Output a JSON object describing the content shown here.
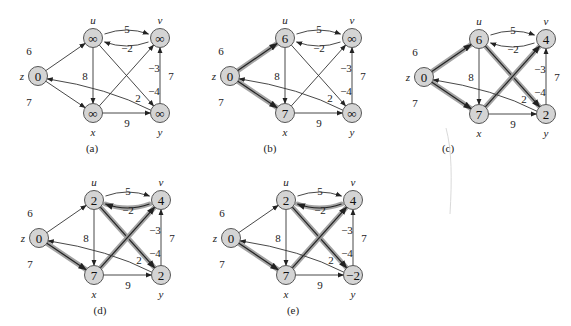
{
  "figure": {
    "colors": {
      "node_fill": "#d4d4d4",
      "node_stroke": "#555555",
      "edge": "#333333",
      "shortest_path_highlight": "#9a9a9a"
    },
    "nodes": [
      "z",
      "u",
      "v",
      "x",
      "y"
    ],
    "edges": [
      {
        "from": "z",
        "to": "u",
        "weight": "6"
      },
      {
        "from": "z",
        "to": "x",
        "weight": "7"
      },
      {
        "from": "u",
        "to": "v",
        "weight": "5"
      },
      {
        "from": "v",
        "to": "u",
        "weight": "−2"
      },
      {
        "from": "u",
        "to": "x",
        "weight": "8"
      },
      {
        "from": "u",
        "to": "y",
        "weight": "−4"
      },
      {
        "from": "x",
        "to": "v",
        "weight": "−3"
      },
      {
        "from": "x",
        "to": "y",
        "weight": "9"
      },
      {
        "from": "y",
        "to": "v",
        "weight": "7"
      },
      {
        "from": "y",
        "to": "z",
        "weight": "2"
      }
    ],
    "panels": [
      {
        "caption": "(a)",
        "values": {
          "z": "0",
          "u": "∞",
          "v": "∞",
          "x": "∞",
          "y": "∞"
        },
        "highlighted": []
      },
      {
        "caption": "(b)",
        "values": {
          "z": "0",
          "u": "6",
          "v": "∞",
          "x": "7",
          "y": "∞"
        },
        "highlighted": [
          "z-u",
          "z-x"
        ]
      },
      {
        "caption": "(c)",
        "values": {
          "z": "0",
          "u": "6",
          "v": "4",
          "x": "7",
          "y": "2"
        },
        "highlighted": [
          "z-u",
          "z-x",
          "x-v",
          "u-y"
        ]
      },
      {
        "caption": "(d)",
        "values": {
          "z": "0",
          "u": "2",
          "v": "4",
          "x": "7",
          "y": "2"
        },
        "highlighted": [
          "z-x",
          "x-v",
          "v-u",
          "u-y"
        ]
      },
      {
        "caption": "(e)",
        "values": {
          "z": "0",
          "u": "2",
          "v": "4",
          "x": "7",
          "y": "−2"
        },
        "highlighted": [
          "z-x",
          "x-v",
          "v-u",
          "u-y"
        ]
      }
    ]
  }
}
